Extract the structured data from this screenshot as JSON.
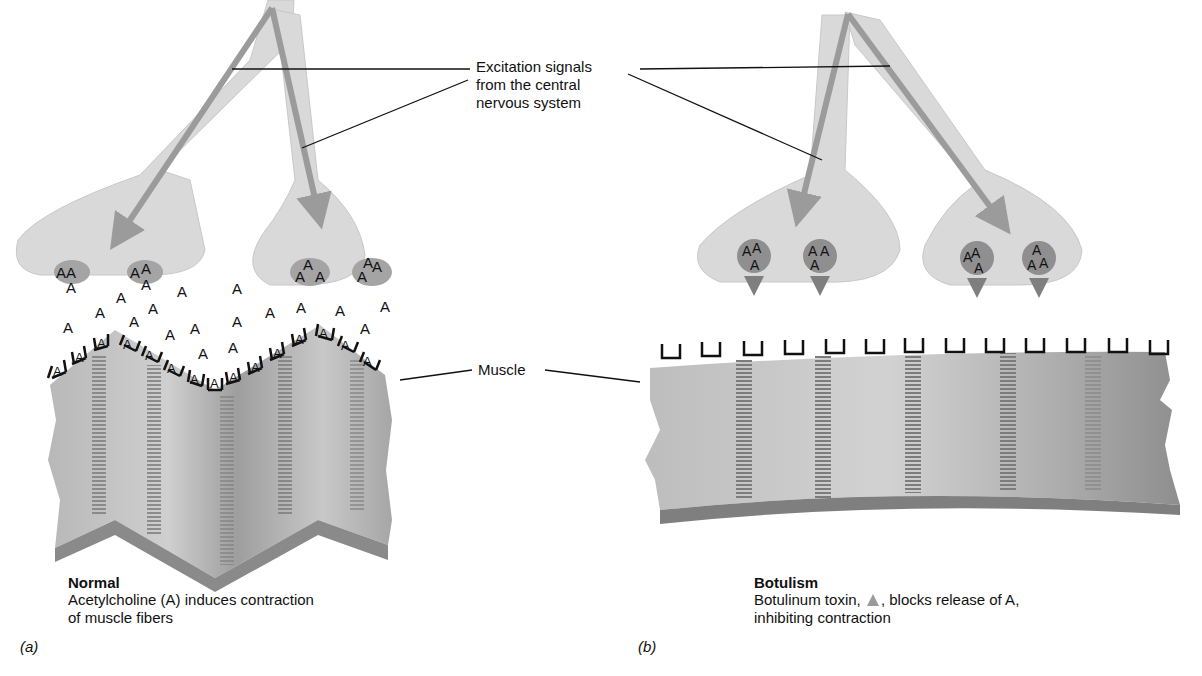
{
  "labels": {
    "excitation": [
      "Excitation signals",
      "from the central",
      "nervous system"
    ],
    "muscle": "Muscle"
  },
  "panels": [
    {
      "tag": "(a)",
      "title": "Normal",
      "caption_lines": [
        "Acetylcholine (A) induces contraction",
        "of muscle fibers"
      ],
      "molecule_letter": "A"
    },
    {
      "tag": "(b)",
      "title": "Botulism",
      "caption_line1_pre": "Botulinum toxin, ",
      "caption_line1_post": ", blocks release of A,",
      "caption_line2": "inhibiting contraction",
      "toxin_icon": "gray-triangle"
    }
  ],
  "colors": {
    "nerve": "#d9d9d9",
    "nerve_edge": "#c6c6c6",
    "arrow": "#9b9b9b",
    "vesicle": "#8f8f8f",
    "muscle_light": "#c2c2c2",
    "muscle_dark": "#8a8a8a",
    "muscle_edge": "#7a7a7a",
    "receptor": "#111111"
  }
}
